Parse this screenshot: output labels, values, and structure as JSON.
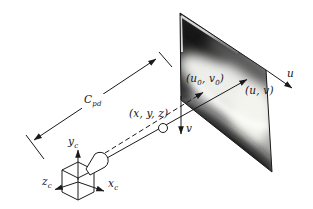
{
  "figure": {
    "labels": {
      "u_axis": "u",
      "v_axis": "v",
      "image_point": "(u, v)",
      "world_point": "(x, y, z)",
      "principal_open": "(u",
      "principal_sub_a": "0",
      "principal_mid": ", v",
      "principal_sub_b": "0",
      "principal_close": ")",
      "distance_base": "C",
      "distance_sub": "pd",
      "cam_y_base": "y",
      "cam_y_sub": "c",
      "cam_z_base": "z",
      "cam_z_sub": "c",
      "cam_x_base": "x",
      "cam_x_sub": "c"
    },
    "colors": {
      "background": "#ffffff",
      "line": "#1a1a1a",
      "xray_base": "#a8a8a8",
      "xray_dark": "#161616",
      "xray_bright": "#f4f4ef"
    }
  }
}
